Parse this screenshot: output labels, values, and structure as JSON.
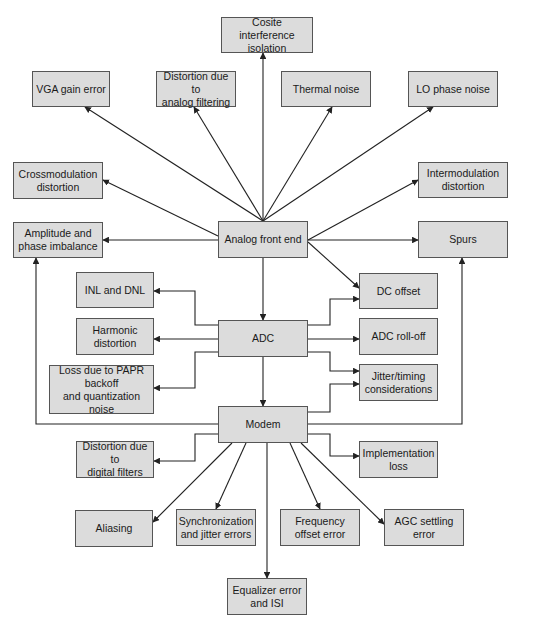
{
  "diagram": {
    "colors": {
      "box_fill": "#dcdcdc",
      "box_border": "#555555",
      "line": "#222222",
      "background": "#ffffff"
    },
    "nodes": [
      {
        "id": "cosite",
        "label": "Cosite interference\nisolation",
        "x": 221,
        "y": 17,
        "w": 92,
        "h": 36
      },
      {
        "id": "vga",
        "label": "VGA gain error",
        "x": 32,
        "y": 71,
        "w": 78,
        "h": 36
      },
      {
        "id": "analog-filter",
        "label": "Distortion due to\nanalog filtering",
        "x": 156,
        "y": 71,
        "w": 80,
        "h": 36
      },
      {
        "id": "thermal",
        "label": "Thermal noise",
        "x": 281,
        "y": 71,
        "w": 90,
        "h": 36
      },
      {
        "id": "lo-phase",
        "label": "LO phase noise",
        "x": 408,
        "y": 71,
        "w": 90,
        "h": 36
      },
      {
        "id": "crossmod",
        "label": "Crossmodulation\ndistortion",
        "x": 13,
        "y": 162,
        "w": 90,
        "h": 37
      },
      {
        "id": "intermod",
        "label": "Intermodulation\ndistortion",
        "x": 418,
        "y": 162,
        "w": 90,
        "h": 36
      },
      {
        "id": "amp-phase",
        "label": "Amplitude and\nphase imbalance",
        "x": 13,
        "y": 222,
        "w": 90,
        "h": 36
      },
      {
        "id": "afe",
        "label": "Analog front end",
        "x": 218,
        "y": 221,
        "w": 90,
        "h": 37
      },
      {
        "id": "spurs",
        "label": "Spurs",
        "x": 418,
        "y": 221,
        "w": 90,
        "h": 37
      },
      {
        "id": "inl-dnl",
        "label": "INL and DNL",
        "x": 76,
        "y": 272,
        "w": 78,
        "h": 36
      },
      {
        "id": "dc-offset",
        "label": "DC offset",
        "x": 359,
        "y": 273,
        "w": 79,
        "h": 36
      },
      {
        "id": "harmonic",
        "label": "Harmonic\ndistortion",
        "x": 76,
        "y": 318,
        "w": 78,
        "h": 37
      },
      {
        "id": "adc",
        "label": "ADC",
        "x": 218,
        "y": 320,
        "w": 90,
        "h": 37
      },
      {
        "id": "adc-rolloff",
        "label": "ADC roll-off",
        "x": 359,
        "y": 318,
        "w": 79,
        "h": 37
      },
      {
        "id": "papr",
        "label": "Loss due to PAPR\nbackoff\nand quantization noise",
        "x": 49,
        "y": 365,
        "w": 105,
        "h": 49
      },
      {
        "id": "jitter-timing",
        "label": "Jitter/timing\nconsiderations",
        "x": 359,
        "y": 364,
        "w": 79,
        "h": 37
      },
      {
        "id": "modem",
        "label": "Modem",
        "x": 218,
        "y": 406,
        "w": 90,
        "h": 37
      },
      {
        "id": "digital-filters",
        "label": "Distortion due to\ndigital filters",
        "x": 76,
        "y": 441,
        "w": 78,
        "h": 37
      },
      {
        "id": "impl-loss",
        "label": "Implementation\nloss",
        "x": 359,
        "y": 441,
        "w": 79,
        "h": 37
      },
      {
        "id": "aliasing",
        "label": "Aliasing",
        "x": 75,
        "y": 510,
        "w": 78,
        "h": 37
      },
      {
        "id": "sync-jitter",
        "label": "Synchronization\nand jitter errors",
        "x": 176,
        "y": 509,
        "w": 80,
        "h": 37
      },
      {
        "id": "freq-offset",
        "label": "Frequency\noffset error",
        "x": 280,
        "y": 509,
        "w": 80,
        "h": 37
      },
      {
        "id": "agc",
        "label": "AGC settling\nerror",
        "x": 384,
        "y": 509,
        "w": 80,
        "h": 37
      },
      {
        "id": "equalizer",
        "label": "Equalizer error\nand ISI",
        "x": 227,
        "y": 578,
        "w": 80,
        "h": 37
      }
    ],
    "edges": [
      {
        "from": "afe",
        "to": "cosite",
        "points": [
          [
            263,
            221
          ],
          [
            263,
            53
          ]
        ]
      },
      {
        "from": "afe",
        "to": "vga",
        "points": [
          [
            263,
            221
          ],
          [
            85,
            107
          ]
        ]
      },
      {
        "from": "afe",
        "to": "analog-filter",
        "points": [
          [
            263,
            221
          ],
          [
            194,
            107
          ]
        ]
      },
      {
        "from": "afe",
        "to": "thermal",
        "points": [
          [
            263,
            221
          ],
          [
            332,
            107
          ]
        ]
      },
      {
        "from": "afe",
        "to": "lo-phase",
        "points": [
          [
            263,
            221
          ],
          [
            433,
            107
          ]
        ]
      },
      {
        "from": "afe",
        "to": "crossmod",
        "points": [
          [
            218,
            236
          ],
          [
            103,
            180
          ]
        ]
      },
      {
        "from": "afe",
        "to": "intermod",
        "points": [
          [
            308,
            240
          ],
          [
            418,
            180
          ]
        ]
      },
      {
        "from": "afe",
        "to": "amp-phase",
        "points": [
          [
            218,
            240
          ],
          [
            103,
            240
          ]
        ]
      },
      {
        "from": "afe",
        "to": "spurs",
        "points": [
          [
            308,
            240
          ],
          [
            418,
            240
          ]
        ]
      },
      {
        "from": "afe",
        "to": "dc-offset",
        "points": [
          [
            308,
            242
          ],
          [
            359,
            288
          ]
        ]
      },
      {
        "from": "afe",
        "to": "adc",
        "points": [
          [
            263,
            258
          ],
          [
            263,
            320
          ]
        ]
      },
      {
        "from": "adc",
        "to": "inl-dnl",
        "points": [
          [
            218,
            325
          ],
          [
            195,
            325
          ],
          [
            195,
            291
          ],
          [
            154,
            291
          ]
        ]
      },
      {
        "from": "adc",
        "to": "harmonic",
        "points": [
          [
            218,
            339
          ],
          [
            154,
            339
          ]
        ]
      },
      {
        "from": "adc",
        "to": "papr",
        "points": [
          [
            218,
            352
          ],
          [
            195,
            352
          ],
          [
            195,
            388
          ],
          [
            154,
            388
          ]
        ]
      },
      {
        "from": "adc",
        "to": "dc-offset",
        "points": [
          [
            308,
            325
          ],
          [
            330,
            325
          ],
          [
            330,
            299
          ],
          [
            359,
            299
          ]
        ]
      },
      {
        "from": "adc",
        "to": "adc-rolloff",
        "points": [
          [
            308,
            339
          ],
          [
            359,
            339
          ]
        ]
      },
      {
        "from": "adc",
        "to": "jitter-timing",
        "points": [
          [
            308,
            352
          ],
          [
            330,
            352
          ],
          [
            330,
            371
          ],
          [
            359,
            371
          ]
        ]
      },
      {
        "from": "adc",
        "to": "modem",
        "points": [
          [
            263,
            357
          ],
          [
            263,
            406
          ]
        ]
      },
      {
        "from": "modem",
        "to": "jitter-timing",
        "points": [
          [
            308,
            412
          ],
          [
            330,
            412
          ],
          [
            330,
            384
          ],
          [
            359,
            384
          ]
        ]
      },
      {
        "from": "modem",
        "to": "amp-phase",
        "points": [
          [
            218,
            424
          ],
          [
            36,
            424
          ],
          [
            36,
            258
          ]
        ]
      },
      {
        "from": "modem",
        "to": "spurs",
        "points": [
          [
            308,
            424
          ],
          [
            462,
            424
          ],
          [
            462,
            258
          ]
        ]
      },
      {
        "from": "modem",
        "to": "digital-filters",
        "points": [
          [
            218,
            434
          ],
          [
            195,
            434
          ],
          [
            195,
            461
          ],
          [
            154,
            461
          ]
        ]
      },
      {
        "from": "modem",
        "to": "impl-loss",
        "points": [
          [
            308,
            434
          ],
          [
            330,
            434
          ],
          [
            330,
            456
          ],
          [
            359,
            456
          ]
        ]
      },
      {
        "from": "modem",
        "to": "aliasing",
        "points": [
          [
            232,
            443
          ],
          [
            153,
            522
          ]
        ]
      },
      {
        "from": "modem",
        "to": "sync-jitter",
        "points": [
          [
            246,
            443
          ],
          [
            216,
            509
          ]
        ]
      },
      {
        "from": "modem",
        "to": "equalizer",
        "points": [
          [
            267,
            443
          ],
          [
            267,
            578
          ]
        ]
      },
      {
        "from": "modem",
        "to": "freq-offset",
        "points": [
          [
            290,
            443
          ],
          [
            320,
            509
          ]
        ]
      },
      {
        "from": "modem",
        "to": "agc",
        "points": [
          [
            301,
            443
          ],
          [
            384,
            524
          ]
        ]
      }
    ]
  }
}
